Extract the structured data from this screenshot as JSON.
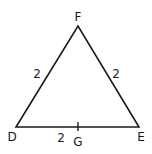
{
  "diagram": {
    "type": "triangle",
    "vertices": {
      "F": {
        "label": "F",
        "x": 78,
        "y": 26
      },
      "D": {
        "label": "D",
        "x": 16,
        "y": 127
      },
      "E": {
        "label": "E",
        "x": 139,
        "y": 127
      }
    },
    "point_G": {
      "label": "G",
      "x": 78,
      "y": 127
    },
    "side_labels": {
      "DF": "2",
      "FE": "2",
      "DG": "2"
    },
    "stroke_color": "#1a1a1a"
  }
}
